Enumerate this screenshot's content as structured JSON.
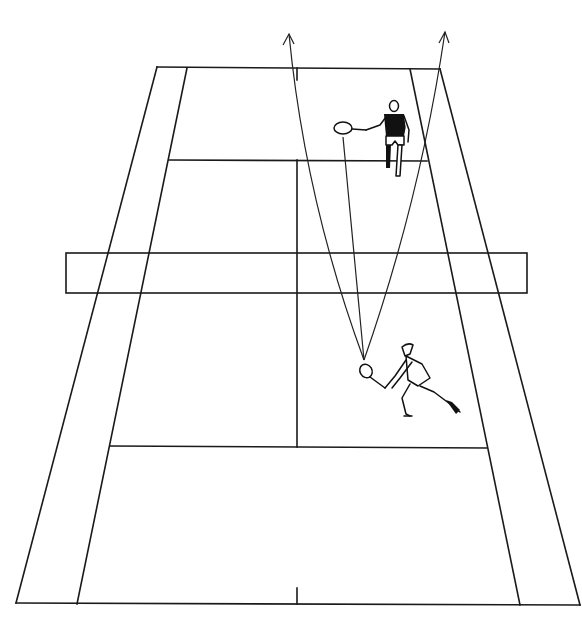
{
  "diagram": {
    "type": "tennis-court-tactics",
    "view": "perspective from behind near baseline",
    "colors": {
      "lines": "#1a1a1a",
      "background": "#ffffff",
      "player_fill": "#111111"
    },
    "court": {
      "far_baseline": {
        "outer_left": [
          157,
          67
        ],
        "inner_left": [
          187,
          68
        ],
        "inner_right": [
          410,
          69
        ],
        "outer_right": [
          440,
          69
        ]
      },
      "near_baseline": {
        "outer_left": [
          16,
          603
        ],
        "inner_left": [
          77,
          604
        ],
        "inner_right": [
          520,
          605
        ],
        "outer_right": [
          580,
          605
        ]
      },
      "far_service_line_y": 160,
      "near_service_line_y": 447,
      "center_line_x": 297,
      "net": {
        "left": 66,
        "right": 527,
        "top": 253,
        "bottom": 293
      }
    },
    "players": [
      {
        "id": "far-player",
        "label": "Opponent at far service line",
        "racket_center": [
          343,
          128
        ],
        "shirt": "dark"
      },
      {
        "id": "near-player",
        "label": "Player hitting low volley",
        "racket_center": [
          372,
          374
        ],
        "shirt": "white"
      }
    ],
    "trajectories": [
      {
        "id": "shot-left",
        "from": [
          364,
          360
        ],
        "to": [
          289,
          34
        ],
        "arrow": true
      },
      {
        "id": "shot-to-opponent",
        "from": [
          364,
          360
        ],
        "to": [
          343,
          137
        ],
        "arrow": false
      },
      {
        "id": "shot-right",
        "from": [
          364,
          360
        ],
        "to": [
          445,
          32
        ],
        "arrow": true
      }
    ],
    "caption": "Tennis court diagram: near player volleys from mid-court; three possible ball paths — lob over left, direct to opponent, lob over right."
  }
}
